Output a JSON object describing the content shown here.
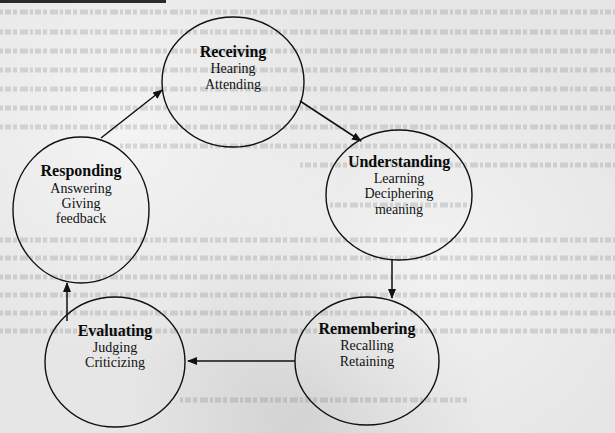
{
  "diagram": {
    "type": "cycle",
    "title": "",
    "nodes": [
      {
        "id": "receiving",
        "title": "Receiving",
        "lines": [
          "Hearing",
          "Attending"
        ]
      },
      {
        "id": "understanding",
        "title": "Understanding",
        "lines": [
          "Learning",
          "Deciphering",
          "meaning"
        ]
      },
      {
        "id": "remembering",
        "title": "Remembering",
        "lines": [
          "Recalling",
          "Retaining"
        ]
      },
      {
        "id": "evaluating",
        "title": "Evaluating",
        "lines": [
          "Judging",
          "Criticizing"
        ]
      },
      {
        "id": "responding",
        "title": "Responding",
        "lines": [
          "Answering",
          "Giving",
          "feedback"
        ]
      }
    ],
    "edges": [
      {
        "from": "receiving",
        "to": "understanding"
      },
      {
        "from": "understanding",
        "to": "remembering"
      },
      {
        "from": "remembering",
        "to": "evaluating"
      },
      {
        "from": "evaluating",
        "to": "responding"
      },
      {
        "from": "responding",
        "to": "receiving"
      }
    ]
  },
  "colors": {
    "ink": "#111111",
    "paper": "#e6e6e6"
  }
}
